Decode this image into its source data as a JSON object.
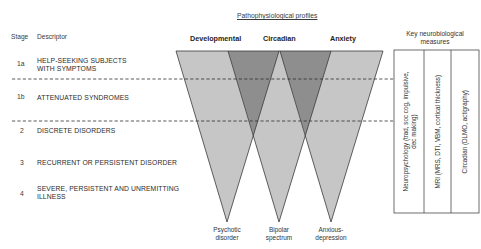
{
  "header": {
    "stage_label": "Stage",
    "descriptor_label": "Descriptor",
    "profiles_title": "Pathophysiological profiles",
    "measures_title_line1": "Key neurobiological",
    "measures_title_line2": "measures"
  },
  "stages": [
    {
      "num": "1a",
      "line1": "HELP-SEEKING SUBJECTS",
      "line2": "WITH SYMPTOMS"
    },
    {
      "num": "1b",
      "line1": "ATTENUATED SYNDROMES",
      "line2": ""
    },
    {
      "num": "2",
      "line1": "DISCRETE DISORDERS",
      "line2": ""
    },
    {
      "num": "3",
      "line1": "RECURRENT OR PERSISTENT DISORDER",
      "line2": ""
    },
    {
      "num": "4",
      "line1": "SEVERE, PERSISTENT AND UNREMITTING",
      "line2": "ILLNESS"
    }
  ],
  "profiles": [
    {
      "name": "Developmental",
      "outcome_line1": "Psychotic",
      "outcome_line2": "disorder"
    },
    {
      "name": "Circadian",
      "outcome_line1": "Bipolar",
      "outcome_line2": "spectrum"
    },
    {
      "name": "Anxiety",
      "outcome_line1": "Anxious-",
      "outcome_line2": "depression"
    }
  ],
  "measures": [
    {
      "line1": "Neuropsychology (trad, soc cog, impulsive,",
      "line2": "dec making)"
    },
    {
      "line1": "MRI (MRS, DTI, VBM, cortical thickness)",
      "line2": ""
    },
    {
      "line1": "Circadian (DLMO, actigraphy)",
      "line2": ""
    }
  ],
  "colors": {
    "triangle_fill": "#c4c4c4",
    "overlap_fill": "#8f8f8f",
    "outline": "#3a3a3a",
    "dashed": "#333333"
  }
}
